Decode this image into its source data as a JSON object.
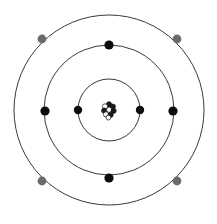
{
  "figure": {
    "background_color": "#ffffff",
    "width": 217,
    "height": 224,
    "center_x": 109,
    "center_y": 110
  },
  "nucleus": {
    "label": "nucleus",
    "center_x": 109,
    "center_y": 110,
    "radius": 7,
    "outline_color": "#111111",
    "fill_color": "#ffffff",
    "nucleon_count": 9,
    "nucleons": [
      {
        "cx": 109.0,
        "cy": 104.4,
        "r": 2.6,
        "fill": "#1a1a1a"
      },
      {
        "cx": 105.0,
        "cy": 106.4,
        "r": 2.6,
        "fill": "#ffffff"
      },
      {
        "cx": 112.8,
        "cy": 106.6,
        "r": 2.6,
        "fill": "#1a1a1a"
      },
      {
        "cx": 104.2,
        "cy": 110.6,
        "r": 2.6,
        "fill": "#1a1a1a"
      },
      {
        "cx": 109.2,
        "cy": 109.8,
        "r": 2.6,
        "fill": "#ffffff"
      },
      {
        "cx": 113.6,
        "cy": 110.8,
        "r": 2.6,
        "fill": "#1a1a1a"
      },
      {
        "cx": 106.0,
        "cy": 114.4,
        "r": 2.6,
        "fill": "#ffffff"
      },
      {
        "cx": 110.6,
        "cy": 114.8,
        "r": 2.6,
        "fill": "#1a1a1a"
      },
      {
        "cx": 108.4,
        "cy": 117.6,
        "r": 2.4,
        "fill": "#ffffff"
      }
    ]
  },
  "shells": [
    {
      "name": "inner-shell",
      "index": 1,
      "radius": 31,
      "stroke_color": "#3a3a3a",
      "stroke_width": 1.0,
      "electron_count": 2,
      "electron_color": "#0d0d0d",
      "electron_radius": 4.2,
      "electrons": [
        {
          "label": "electron-inner-left",
          "cx": 78,
          "cy": 110
        },
        {
          "label": "electron-inner-right",
          "cx": 140,
          "cy": 110
        }
      ]
    },
    {
      "name": "middle-shell",
      "index": 2,
      "radius": 65,
      "stroke_color": "#3a3a3a",
      "stroke_width": 1.0,
      "electron_count": 4,
      "electron_color": "#0d0d0d",
      "electron_radius": 4.6,
      "electrons": [
        {
          "label": "electron-middle-top",
          "cx": 109,
          "cy": 45
        },
        {
          "label": "electron-middle-left",
          "cx": 45,
          "cy": 111
        },
        {
          "label": "electron-middle-right",
          "cx": 173,
          "cy": 111
        },
        {
          "label": "electron-middle-bottom",
          "cx": 109,
          "cy": 178
        }
      ]
    },
    {
      "name": "outer-shell",
      "index": 3,
      "radius": 95,
      "stroke_color": "#3a3a3a",
      "stroke_width": 1.0,
      "electron_count": 4,
      "electron_color": "#6b6b6b",
      "electron_radius": 4.4,
      "electrons": [
        {
          "label": "electron-outer-top-left",
          "cx": 42,
          "cy": 39
        },
        {
          "label": "electron-outer-top-right",
          "cx": 177,
          "cy": 39
        },
        {
          "label": "electron-outer-bottom-left",
          "cx": 42,
          "cy": 181
        },
        {
          "label": "electron-outer-bottom-right",
          "cx": 177,
          "cy": 181
        }
      ]
    }
  ]
}
